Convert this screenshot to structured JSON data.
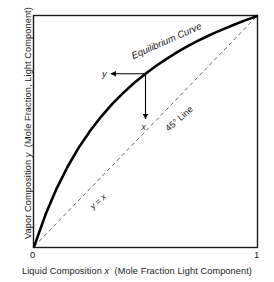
{
  "chart_data": {
    "type": "line",
    "title": "",
    "subtitle": "",
    "xlabel_full": "Liquid Composition x  (Mole Fraction Light Component)",
    "ylabel_full": "Vapor Composition y  (Mole Fraction, Light Component)",
    "xlabel_prefix": "Liquid Composition",
    "xlabel_var": "x",
    "xlabel_suffix": "(Mole Fraction Light Component)",
    "ylabel_prefix": "Vapor Composition",
    "ylabel_var": "y",
    "ylabel_suffix": "(Mole Fraction, Light Component)",
    "xlim": [
      0,
      1
    ],
    "ylim": [
      0,
      1
    ],
    "xticks": [
      "0",
      "1"
    ],
    "yticks": [],
    "grid": false,
    "legend": "none",
    "frame": true,
    "series": [
      {
        "name": "Equilibrium Curve",
        "style": "solid",
        "width": 2.6,
        "color": "#000000",
        "x": [
          0.0,
          0.05,
          0.1,
          0.15,
          0.2,
          0.25,
          0.3,
          0.35,
          0.4,
          0.45,
          0.5,
          0.55,
          0.6,
          0.65,
          0.7,
          0.75,
          0.8,
          0.85,
          0.9,
          0.95,
          1.0
        ],
        "y": [
          0.0,
          0.136,
          0.25,
          0.346,
          0.429,
          0.5,
          0.563,
          0.618,
          0.667,
          0.711,
          0.75,
          0.786,
          0.818,
          0.848,
          0.875,
          0.9,
          0.923,
          0.944,
          0.964,
          0.983,
          1.0
        ]
      },
      {
        "name": "45 Degree Line",
        "style": "dashed",
        "width": 0.9,
        "color": "#555555",
        "x": [
          0,
          1
        ],
        "y": [
          0,
          1
        ]
      }
    ],
    "annotations": [
      {
        "name": "equilibrium-curve-label",
        "text": "Equilibrium Curve",
        "x": 0.6,
        "y": 0.88,
        "rotation": -24
      },
      {
        "name": "forty-five-line-label",
        "text": "45° Line",
        "x": 0.66,
        "y": 0.545,
        "rotation": -41
      },
      {
        "name": "y-equals-x-label",
        "text": "y = x",
        "x": 0.295,
        "y": 0.185,
        "rotation": -41
      },
      {
        "name": "vapor-composition-y-label",
        "text": "y",
        "x": 0.315,
        "y": 0.735
      },
      {
        "name": "liquid-composition-x-label",
        "text": "x",
        "x": 0.492,
        "y": 0.505
      }
    ],
    "tie_point": {
      "x": 0.5,
      "y": 0.75
    },
    "arrows": [
      {
        "name": "y-arrow",
        "from": [
          0.5,
          0.75
        ],
        "to": [
          0.345,
          0.75
        ],
        "direction": "left"
      },
      {
        "name": "x-arrow",
        "from": [
          0.5,
          0.75
        ],
        "to": [
          0.5,
          0.555
        ],
        "direction": "down"
      }
    ]
  }
}
